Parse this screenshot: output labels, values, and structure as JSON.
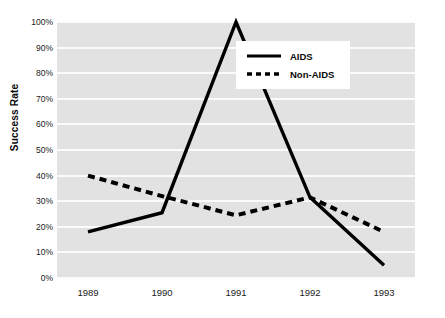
{
  "chart_data": {
    "type": "line",
    "title": "",
    "xlabel": "",
    "ylabel": "Success Rate",
    "categories": [
      "1989",
      "1990",
      "1991",
      "1992",
      "1993"
    ],
    "ylim": [
      0,
      100
    ],
    "ytick_labels": [
      "0%",
      "10%",
      "20%",
      "30%",
      "40%",
      "50%",
      "60%",
      "70%",
      "80%",
      "90%",
      "100%"
    ],
    "ytick_values": [
      0,
      10,
      20,
      30,
      40,
      50,
      60,
      70,
      80,
      90,
      100
    ],
    "grid": true,
    "legend_position": "upper-right",
    "series": [
      {
        "name": "AIDS",
        "style": "solid",
        "color": "#000000",
        "values": [
          18,
          25.5,
          100,
          31.5,
          5
        ]
      },
      {
        "name": "Non-AIDS",
        "style": "dashed",
        "color": "#000000",
        "values": [
          40,
          32,
          24.5,
          31.5,
          18
        ]
      }
    ]
  },
  "axes": {
    "y_title": "Success Rate"
  },
  "legend": {
    "entries": [
      {
        "label": "AIDS"
      },
      {
        "label": "Non-AIDS"
      }
    ]
  }
}
